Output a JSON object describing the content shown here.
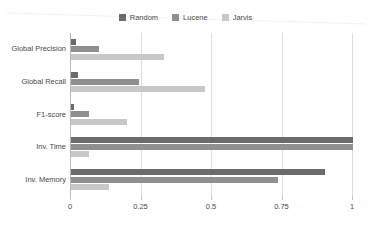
{
  "chart_data": {
    "type": "bar",
    "orientation": "horizontal",
    "title": "",
    "subtitle": "",
    "xlabel": "",
    "ylabel": "",
    "categories": [
      "Global Precision",
      "Global Recall",
      "F1-score",
      "Inv. Time",
      "Inv. Memory"
    ],
    "series": [
      {
        "name": "Random",
        "color": "#6b6b6b",
        "values": [
          0.018,
          0.026,
          0.012,
          1.0,
          0.9
        ]
      },
      {
        "name": "Lucene",
        "color": "#8f8f8f",
        "values": [
          0.1,
          0.24,
          0.065,
          1.0,
          0.735
        ]
      },
      {
        "name": "Jarvis",
        "color": "#c8c8c8",
        "values": [
          0.33,
          0.475,
          0.2,
          0.065,
          0.135
        ]
      }
    ],
    "xlim": [
      0,
      1
    ],
    "ylim": null,
    "xticks": [
      0,
      0.25,
      0.5,
      0.75,
      1
    ],
    "xtick_labels": [
      "0",
      "0.25",
      "0.5",
      "0.75",
      "1"
    ],
    "grid": "vertical",
    "legend_position": "top-center"
  },
  "legend": {
    "items": [
      {
        "label": "Random",
        "color": "#6b6b6b"
      },
      {
        "label": "Lucene",
        "color": "#8f8f8f"
      },
      {
        "label": "Jarvis",
        "color": "#c8c8c8"
      }
    ]
  },
  "axes": {
    "y_categories": [
      "Global Precision",
      "Global Recall",
      "F1-score",
      "Inv. Time",
      "Inv. Memory"
    ],
    "x_tick_labels": [
      "0",
      "0.25",
      "0.5",
      "0.75",
      "1"
    ]
  },
  "colors": {
    "background": "#ffffff",
    "gridline": "#dedede",
    "axis": "#b9b9b9",
    "text": "#4a4a4a",
    "series_random": "#6b6b6b",
    "series_lucene": "#8f8f8f",
    "series_jarvis": "#c8c8c8"
  }
}
